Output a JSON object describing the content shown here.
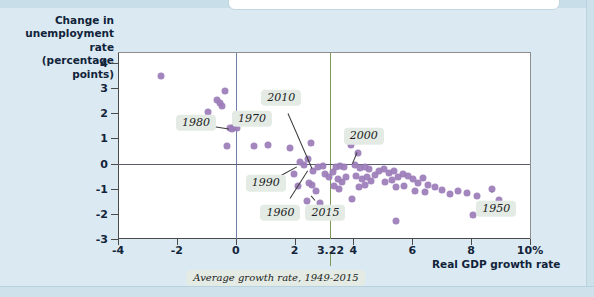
{
  "figure": {
    "background_color": "#dbeaf2",
    "plot_background": "#ffffff",
    "dot_color": "#9b7cb8",
    "zero_vline_color": "#6f7fa8",
    "average_vline_color": "#7c9a55"
  },
  "axes": {
    "y_title": "Change in unemployment rate (percentage points)",
    "x_title": "Real GDP growth rate",
    "y_ticks": [
      "4",
      "3",
      "2",
      "1",
      "0",
      "-1",
      "-2",
      "-3"
    ],
    "x_ticks": [
      "-4",
      "-2",
      "0",
      "2",
      "3.22",
      "4",
      "6",
      "8",
      "10%"
    ]
  },
  "annotations": {
    "average_note": "Average growth rate, 1949-2015"
  },
  "chart_data": {
    "type": "scatter",
    "title": "",
    "xlabel": "Real GDP growth rate",
    "ylabel": "Change in unemployment rate (percentage points)",
    "xlim": [
      -4,
      10
    ],
    "ylim": [
      -3,
      4.4
    ],
    "grid": false,
    "legend": null,
    "reference_lines": [
      {
        "name": "zero-growth-line",
        "axis": "x",
        "value": 0,
        "color": "#6f7fa8"
      },
      {
        "name": "average-growth-line",
        "axis": "x",
        "value": 3.22,
        "color": "#7c9a55",
        "label": "Average growth rate, 1949-2015"
      },
      {
        "name": "zero-change-line",
        "axis": "y",
        "value": 0,
        "color": "#5d5d6e"
      }
    ],
    "y_ticks": [
      4,
      3,
      2,
      1,
      0,
      -1,
      -2,
      -3
    ],
    "x_ticks": [
      -4,
      -2,
      0,
      2,
      3.22,
      4,
      6,
      8,
      10
    ],
    "points": [
      {
        "x": -2.55,
        "y": 3.5
      },
      {
        "x": -0.95,
        "y": 2.07
      },
      {
        "x": -0.36,
        "y": 2.88
      },
      {
        "x": -0.62,
        "y": 2.55
      },
      {
        "x": -0.55,
        "y": 2.42
      },
      {
        "x": -0.47,
        "y": 2.28
      },
      {
        "x": -0.18,
        "y": 1.42
      },
      {
        "x": -0.12,
        "y": 1.38
      },
      {
        "x": -0.05,
        "y": 1.45
      },
      {
        "x": 0.05,
        "y": 1.43
      },
      {
        "x": -0.3,
        "y": 0.7
      },
      {
        "x": 0.62,
        "y": 0.7
      },
      {
        "x": 1.1,
        "y": 0.72
      },
      {
        "x": 1.86,
        "y": 0.63
      },
      {
        "x": 2.55,
        "y": 0.82
      },
      {
        "x": 2.45,
        "y": 0.18
      },
      {
        "x": 2.62,
        "y": -0.28
      },
      {
        "x": 2.8,
        "y": -0.12
      },
      {
        "x": 2.95,
        "y": -0.1
      },
      {
        "x": 2.18,
        "y": 0.05
      },
      {
        "x": 2.32,
        "y": -0.05
      },
      {
        "x": 1.98,
        "y": -0.42
      },
      {
        "x": 2.1,
        "y": -0.88
      },
      {
        "x": 2.48,
        "y": -0.78
      },
      {
        "x": 2.6,
        "y": -0.85
      },
      {
        "x": 2.72,
        "y": -1.1
      },
      {
        "x": 2.42,
        "y": -1.48
      },
      {
        "x": 3.05,
        "y": -0.42
      },
      {
        "x": 3.18,
        "y": -0.55
      },
      {
        "x": 3.3,
        "y": -0.35
      },
      {
        "x": 3.42,
        "y": -0.12
      },
      {
        "x": 3.55,
        "y": -0.08
      },
      {
        "x": 3.68,
        "y": -0.15
      },
      {
        "x": 3.48,
        "y": -0.62
      },
      {
        "x": 3.62,
        "y": -0.72
      },
      {
        "x": 3.75,
        "y": -0.55
      },
      {
        "x": 3.35,
        "y": -0.9
      },
      {
        "x": 3.52,
        "y": -1.02
      },
      {
        "x": 3.92,
        "y": 0.72
      },
      {
        "x": 4.15,
        "y": 0.42
      },
      {
        "x": 4.05,
        "y": -0.05
      },
      {
        "x": 4.22,
        "y": -0.18
      },
      {
        "x": 4.38,
        "y": -0.12
      },
      {
        "x": 4.52,
        "y": -0.22
      },
      {
        "x": 4.1,
        "y": -0.48
      },
      {
        "x": 4.28,
        "y": -0.6
      },
      {
        "x": 4.45,
        "y": -0.52
      },
      {
        "x": 4.6,
        "y": -0.68
      },
      {
        "x": 4.18,
        "y": -0.95
      },
      {
        "x": 4.4,
        "y": -0.85
      },
      {
        "x": 4.72,
        "y": -0.45
      },
      {
        "x": 4.88,
        "y": -0.3
      },
      {
        "x": 5.05,
        "y": -0.22
      },
      {
        "x": 5.2,
        "y": -0.38
      },
      {
        "x": 5.38,
        "y": -0.28
      },
      {
        "x": 5.08,
        "y": -0.72
      },
      {
        "x": 5.3,
        "y": -0.65
      },
      {
        "x": 5.52,
        "y": -0.55
      },
      {
        "x": 5.68,
        "y": -0.42
      },
      {
        "x": 5.85,
        "y": -0.48
      },
      {
        "x": 5.45,
        "y": -0.95
      },
      {
        "x": 5.72,
        "y": -0.88
      },
      {
        "x": 6.02,
        "y": -0.62
      },
      {
        "x": 6.2,
        "y": -0.78
      },
      {
        "x": 6.38,
        "y": -0.58
      },
      {
        "x": 6.55,
        "y": -0.85
      },
      {
        "x": 6.1,
        "y": -1.08
      },
      {
        "x": 6.42,
        "y": -1.12
      },
      {
        "x": 6.78,
        "y": -0.95
      },
      {
        "x": 7.0,
        "y": -1.05
      },
      {
        "x": 7.28,
        "y": -1.22
      },
      {
        "x": 7.55,
        "y": -1.1
      },
      {
        "x": 7.85,
        "y": -1.18
      },
      {
        "x": 8.2,
        "y": -1.28
      },
      {
        "x": 8.7,
        "y": -1.02
      },
      {
        "x": 8.95,
        "y": -1.45
      },
      {
        "x": 5.45,
        "y": -2.28
      },
      {
        "x": 8.05,
        "y": -2.05
      },
      {
        "x": 3.95,
        "y": -1.42
      },
      {
        "x": 2.88,
        "y": -1.58
      }
    ],
    "annotations": [
      {
        "label": "1980",
        "chip_x": -1.35,
        "chip_y": 1.62,
        "target_x": -0.18,
        "target_y": 1.4
      },
      {
        "label": "1970",
        "chip_x": 0.55,
        "chip_y": 1.78,
        "target_x": 0.05,
        "target_y": 1.44
      },
      {
        "label": "2010",
        "chip_x": 1.55,
        "chip_y": 2.62,
        "target_x": 2.62,
        "target_y": -0.26
      },
      {
        "label": "2000",
        "chip_x": 4.35,
        "chip_y": 1.08,
        "target_x": 3.95,
        "target_y": -0.08
      },
      {
        "label": "1990",
        "chip_x": 1.02,
        "chip_y": -0.78,
        "target_x": 2.12,
        "target_y": -0.08
      },
      {
        "label": "1960",
        "chip_x": 1.52,
        "chip_y": -1.95,
        "target_x": 2.46,
        "target_y": -0.22
      },
      {
        "label": "2015",
        "chip_x": 3.05,
        "chip_y": -1.95,
        "target_x": 2.5,
        "target_y": -1.18
      },
      {
        "label": "1950",
        "chip_x": 8.85,
        "chip_y": -1.8,
        "target_x": 8.7,
        "target_y": -1.02
      }
    ]
  }
}
